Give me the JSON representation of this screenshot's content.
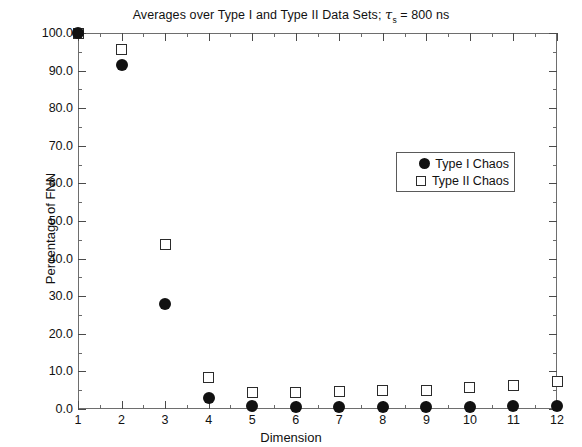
{
  "chart_data": {
    "type": "scatter",
    "title": "Averages over Type I and Type II Data Sets; τs = 800 ns",
    "title_main": "Averages over Type I and Type II Data Sets; ",
    "title_tau": "τ",
    "title_tau_sub": "s",
    "title_tail": " = 800 ns",
    "xlabel": "Dimension",
    "ylabel": "Percentage of FNN",
    "xlim": [
      1,
      12
    ],
    "ylim": [
      0.0,
      100.0
    ],
    "grid": false,
    "legend_position": "upper-center-right",
    "x": [
      1,
      2,
      3,
      4,
      5,
      6,
      7,
      8,
      9,
      10,
      11,
      12
    ],
    "xticklabels": [
      "1",
      "2",
      "3",
      "4",
      "5",
      "6",
      "7",
      "8",
      "9",
      "10",
      "11",
      "12"
    ],
    "yticks": [
      0.0,
      10.0,
      20.0,
      30.0,
      40.0,
      50.0,
      60.0,
      70.0,
      80.0,
      90.0,
      100.0
    ],
    "yticklabels": [
      "0.0",
      "10.0",
      "20.0",
      "30.0",
      "40.0",
      "50.0",
      "60.0",
      "70.0",
      "80.0",
      "90.0",
      "100.0"
    ],
    "series": [
      {
        "name": "Type I Chaos",
        "marker": "filled-circle",
        "color": "#111111",
        "values": [
          100.0,
          91.5,
          28.0,
          2.8,
          0.7,
          0.5,
          0.5,
          0.5,
          0.5,
          0.6,
          0.7,
          0.9
        ]
      },
      {
        "name": "Type II Chaos",
        "marker": "open-square",
        "color": "#2b2b2b",
        "values": [
          100.0,
          95.7,
          43.7,
          8.3,
          4.4,
          4.4,
          4.6,
          4.8,
          5.0,
          5.6,
          6.3,
          7.4
        ]
      }
    ]
  },
  "legend": {
    "entries": [
      {
        "label": "Type I Chaos",
        "marker": "filled-circle"
      },
      {
        "label": "Type II Chaos",
        "marker": "open-square"
      }
    ]
  }
}
